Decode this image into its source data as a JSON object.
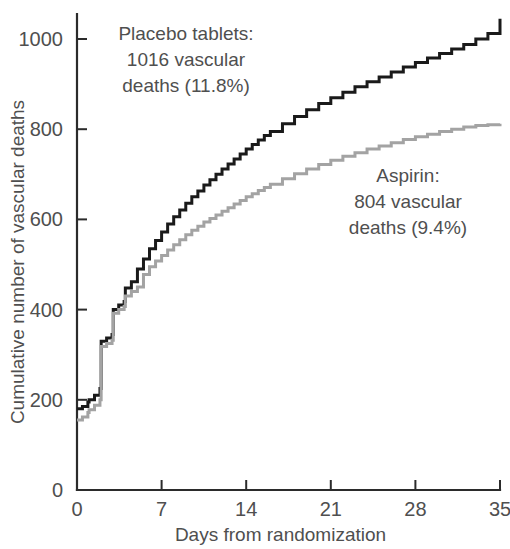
{
  "chart_data": {
    "type": "line",
    "subtype": "step-cumulative-incidence",
    "title": "",
    "xlabel": "Days from randomization",
    "ylabel": "Cumulative number of vascular deaths",
    "xlim": [
      0,
      35
    ],
    "ylim": [
      0,
      1060
    ],
    "xticks": [
      0,
      7,
      14,
      21,
      28,
      35
    ],
    "xtick_labels": [
      "0",
      "7",
      "14",
      "21",
      "28",
      "35"
    ],
    "yticks": [
      0,
      200,
      400,
      600,
      800,
      1000
    ],
    "ytick_labels": [
      "0",
      "200",
      "400",
      "600",
      "800",
      "1000"
    ],
    "grid": false,
    "legend_position": "inline-annotations",
    "series": [
      {
        "name": "Placebo tablets",
        "color": "#1a1a1a",
        "stroke_width": 3.0,
        "total_deaths": 1016,
        "percent": "11.8%",
        "x": [
          0,
          0.45,
          0.9,
          1.0,
          1.45,
          1.9,
          2.0,
          2.45,
          2.9,
          3.0,
          3.45,
          3.9,
          4.0,
          4.5,
          5.0,
          5.5,
          6.0,
          6.5,
          7.0,
          7.5,
          8.0,
          8.5,
          9.0,
          9.5,
          10.0,
          10.5,
          11.0,
          11.5,
          12.0,
          12.5,
          13.0,
          13.5,
          14.0,
          14.5,
          15.0,
          15.5,
          16.0,
          17.0,
          18.0,
          19.0,
          20.0,
          21.0,
          22.0,
          23.0,
          24.0,
          25.0,
          26.0,
          27.0,
          28.0,
          29.0,
          30.0,
          31.0,
          32.0,
          33.0,
          34.0,
          35.0
        ],
        "y": [
          180,
          185,
          195,
          200,
          210,
          225,
          330,
          337,
          345,
          400,
          410,
          418,
          448,
          462,
          490,
          512,
          535,
          553,
          572,
          590,
          606,
          621,
          636,
          650,
          663,
          676,
          688,
          700,
          712,
          723,
          734,
          745,
          756,
          766,
          776,
          786,
          795,
          812,
          828,
          843,
          857,
          870,
          882,
          894,
          905,
          916,
          927,
          938,
          948,
          958,
          968,
          978,
          988,
          1000,
          1012,
          1045
        ]
      },
      {
        "name": "Aspirin",
        "color": "#a3a3a3",
        "stroke_width": 3.0,
        "total_deaths": 804,
        "percent": "9.4%",
        "x": [
          0,
          0.45,
          0.9,
          1.0,
          1.45,
          1.9,
          2.0,
          2.45,
          2.9,
          3.0,
          3.45,
          3.9,
          4.0,
          4.5,
          5.0,
          5.5,
          6.0,
          6.5,
          7.0,
          7.5,
          8.0,
          8.5,
          9.0,
          9.5,
          10.0,
          10.5,
          11.0,
          11.5,
          12.0,
          12.5,
          13.0,
          13.5,
          14.0,
          14.5,
          15.0,
          15.5,
          16.0,
          17.0,
          18.0,
          19.0,
          20.0,
          21.0,
          22.0,
          23.0,
          24.0,
          25.0,
          26.0,
          27.0,
          28.0,
          29.0,
          30.0,
          31.0,
          32.0,
          33.0,
          34.0,
          35.0
        ],
        "y": [
          155,
          162,
          172,
          178,
          188,
          200,
          318,
          325,
          332,
          392,
          400,
          407,
          430,
          440,
          450,
          478,
          495,
          508,
          520,
          532,
          544,
          555,
          566,
          576,
          585,
          594,
          602,
          610,
          618,
          626,
          634,
          642,
          650,
          657,
          664,
          671,
          678,
          690,
          701,
          712,
          722,
          731,
          740,
          748,
          756,
          763,
          770,
          777,
          783,
          789,
          795,
          800,
          805,
          808,
          810,
          812
        ]
      }
    ],
    "annotations": [
      {
        "id": "placebo-annotation",
        "lines": [
          "Placebo tablets:",
          "1016 vascular",
          "deaths (11.8%)"
        ],
        "x_px": 186,
        "y_px": 40
      },
      {
        "id": "aspirin-annotation",
        "lines": [
          "Aspirin:",
          "804 vascular",
          "deaths (9.4%)"
        ],
        "x_px": 408,
        "y_px": 182
      }
    ],
    "colors": {
      "placebo": "#1a1a1a",
      "aspirin": "#a3a3a3",
      "axis": "#2b2b2b",
      "text": "#4f4f4f",
      "background": "#ffffff"
    }
  }
}
